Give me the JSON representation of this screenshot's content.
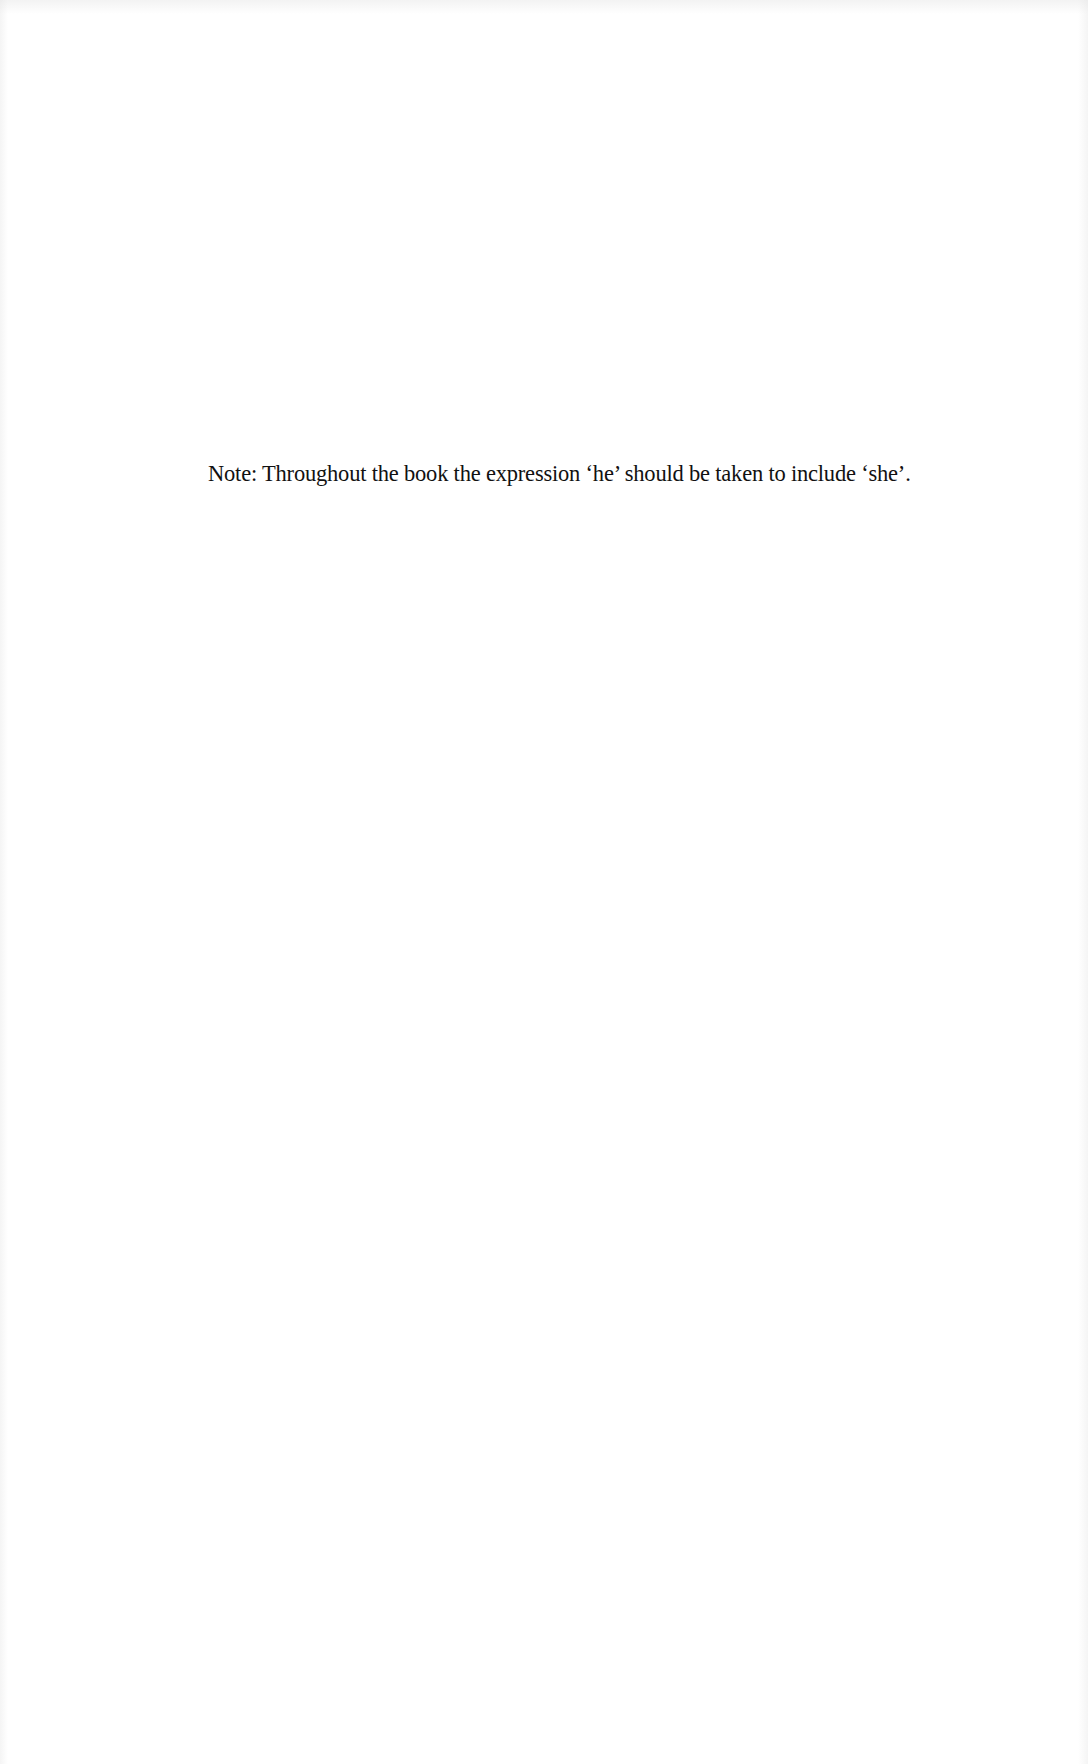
{
  "document": {
    "note": "Note: Throughout the book the expression ‘he’ should be taken to include ‘she’."
  }
}
